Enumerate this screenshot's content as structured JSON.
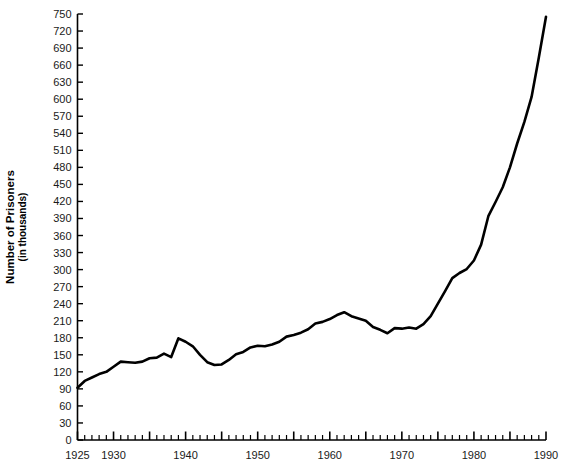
{
  "chart_data": {
    "type": "line",
    "title": "",
    "xlabel": "",
    "ylabel": "Number of Prisoners",
    "ylabel_sub": "(in thousands)",
    "xlim": [
      1925,
      1990
    ],
    "ylim": [
      0,
      750
    ],
    "grid": false,
    "legend": "none",
    "line_color": "#000000",
    "y_ticks": [
      0,
      30,
      60,
      90,
      120,
      150,
      180,
      210,
      240,
      270,
      300,
      330,
      360,
      390,
      420,
      450,
      480,
      510,
      540,
      570,
      600,
      630,
      660,
      690,
      720,
      750
    ],
    "y_tick_labels": [
      "0",
      "30",
      "60",
      "90",
      "120",
      "150",
      "180",
      "210",
      "240",
      "270",
      "300",
      "330",
      "360",
      "390",
      "420",
      "450",
      "480",
      "510",
      "540",
      "570",
      "600",
      "630",
      "660",
      "690",
      "720",
      "750"
    ],
    "x_ticks_major": [
      1925,
      1930,
      1940,
      1950,
      1960,
      1970,
      1980,
      1990
    ],
    "x_tick_labels": [
      "1925",
      "1930",
      "1940",
      "1950",
      "1960",
      "1970",
      "1980",
      "1990"
    ],
    "x_tick_minor_step": 1,
    "x": [
      1925,
      1926,
      1927,
      1928,
      1929,
      1930,
      1931,
      1932,
      1933,
      1934,
      1935,
      1936,
      1937,
      1938,
      1939,
      1940,
      1941,
      1942,
      1943,
      1944,
      1945,
      1946,
      1947,
      1948,
      1949,
      1950,
      1951,
      1952,
      1953,
      1954,
      1955,
      1956,
      1957,
      1958,
      1959,
      1960,
      1961,
      1962,
      1963,
      1964,
      1965,
      1966,
      1967,
      1968,
      1969,
      1970,
      1971,
      1972,
      1973,
      1974,
      1975,
      1976,
      1977,
      1978,
      1979,
      1980,
      1981,
      1982,
      1983,
      1984,
      1985,
      1986,
      1987,
      1988,
      1989,
      1990
    ],
    "y": [
      92,
      104,
      110,
      116,
      120,
      129,
      138,
      137,
      136,
      138,
      144,
      145,
      152,
      146,
      179,
      173,
      165,
      150,
      137,
      132,
      133,
      141,
      151,
      155,
      163,
      166,
      165,
      168,
      173,
      182,
      185,
      189,
      195,
      205,
      208,
      213,
      220,
      225,
      218,
      214,
      210,
      199,
      194,
      188,
      197,
      196,
      198,
      196,
      204,
      218,
      240,
      262,
      285,
      294,
      301,
      316,
      344,
      394,
      419,
      445,
      480,
      522,
      560,
      604,
      673,
      745
    ],
    "annotations": []
  }
}
